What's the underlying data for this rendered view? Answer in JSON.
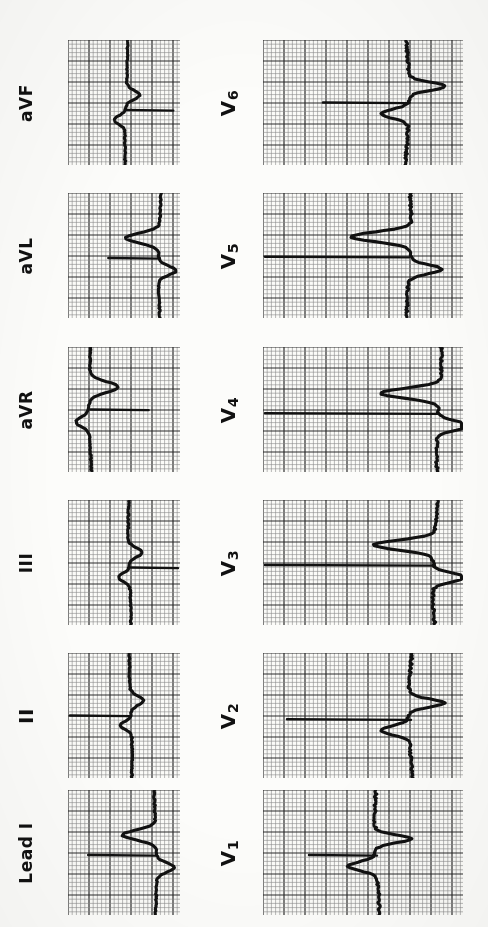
{
  "document": {
    "type": "12-lead electrocardiogram (ECG) scan",
    "orientation": "rotated-90-ccw",
    "background_color": "#fcfcfa",
    "trace_color": "#111111",
    "grid_fine_color": "#8a8a8a",
    "grid_bold_color": "#2b2b2b",
    "width": 488,
    "height": 927
  },
  "grid": {
    "fine_spacing_px": 4.2,
    "bold_every": 5,
    "fine_line_width": 0.6,
    "bold_line_width": 1.2
  },
  "columns": [
    {
      "id": "limb",
      "name": "limb-leads",
      "x": 68,
      "width": 112,
      "label_x": 26
    },
    {
      "id": "precordial",
      "name": "precordial-leads",
      "x": 263,
      "width": 200,
      "label_x": 228
    }
  ],
  "rows": [
    {
      "y": 40,
      "height": 125
    },
    {
      "y": 193,
      "height": 125
    },
    {
      "y": 347,
      "height": 125
    },
    {
      "y": 500,
      "height": 125
    },
    {
      "y": 653,
      "height": 125
    },
    {
      "y": 790,
      "height": 125
    }
  ],
  "leads": [
    {
      "name": "aVF",
      "label": "aVF",
      "sub": "",
      "column": "limb",
      "row": 0,
      "baseline_frac": 0.56,
      "spike_dir": "right",
      "spike_len_frac": 0.42,
      "qrs_axis_frac": 0.52,
      "morphology": "small-qrs-noisy-baseline"
    },
    {
      "name": "aVL",
      "label": "aVL",
      "sub": "",
      "column": "limb",
      "row": 1,
      "baseline_frac": 0.52,
      "spike_dir": "left",
      "spike_len_frac": 0.46,
      "qrs_axis_frac": 0.82,
      "morphology": "tall-r-right-shifted"
    },
    {
      "name": "aVR",
      "label": "aVR",
      "sub": "",
      "column": "limb",
      "row": 2,
      "baseline_frac": 0.5,
      "spike_dir": "right",
      "spike_len_frac": 0.52,
      "qrs_axis_frac": 0.2,
      "morphology": "deep-negative-left-shifted"
    },
    {
      "name": "III",
      "label": "III",
      "sub": "",
      "column": "limb",
      "row": 3,
      "baseline_frac": 0.54,
      "spike_dir": "right",
      "spike_len_frac": 0.62,
      "qrs_axis_frac": 0.55,
      "morphology": "biphasic-qrs"
    },
    {
      "name": "II",
      "label": "II",
      "sub": "",
      "column": "limb",
      "row": 4,
      "baseline_frac": 0.5,
      "spike_dir": "left",
      "spike_len_frac": 0.58,
      "qrs_axis_frac": 0.56,
      "morphology": "notched-qrs"
    },
    {
      "name": "Lead I",
      "label": "Lead I",
      "sub": "",
      "column": "limb",
      "row": 5,
      "baseline_frac": 0.52,
      "spike_dir": "left",
      "spike_len_frac": 0.6,
      "qrs_axis_frac": 0.78,
      "morphology": "tall-r-wide"
    },
    {
      "name": "V6",
      "label": "V",
      "sub": "6",
      "column": "precordial",
      "row": 0,
      "baseline_frac": 0.5,
      "spike_dir": "left",
      "spike_len_frac": 0.42,
      "qrs_axis_frac": 0.72,
      "morphology": "small-rs-complex"
    },
    {
      "name": "V5",
      "label": "V",
      "sub": "5",
      "column": "precordial",
      "row": 1,
      "baseline_frac": 0.51,
      "spike_dir": "left",
      "spike_len_frac": 0.78,
      "qrs_axis_frac": 0.73,
      "morphology": "tall-r-deep-s"
    },
    {
      "name": "V4",
      "label": "V",
      "sub": "4",
      "column": "precordial",
      "row": 2,
      "baseline_frac": 0.53,
      "spike_dir": "left",
      "spike_len_frac": 0.92,
      "qrs_axis_frac": 0.88,
      "morphology": "very-tall-r"
    },
    {
      "name": "V3",
      "label": "V",
      "sub": "3",
      "column": "precordial",
      "row": 3,
      "baseline_frac": 0.52,
      "spike_dir": "left",
      "spike_len_frac": 0.95,
      "qrs_axis_frac": 0.86,
      "morphology": "tall-r-rs-transition"
    },
    {
      "name": "V2",
      "label": "V",
      "sub": "2",
      "column": "precordial",
      "row": 4,
      "baseline_frac": 0.53,
      "spike_dir": "left",
      "spike_len_frac": 0.62,
      "qrs_axis_frac": 0.74,
      "morphology": "rs-complex"
    },
    {
      "name": "V1",
      "label": "V",
      "sub": "1",
      "column": "precordial",
      "row": 5,
      "baseline_frac": 0.52,
      "spike_dir": "left",
      "spike_len_frac": 0.34,
      "qrs_axis_frac": 0.57,
      "morphology": "small-r-large-s"
    }
  ],
  "chart_data": {
    "type": "line",
    "xlabel": "",
    "ylabel": "",
    "grid": true,
    "legend_position": "none",
    "note": "Scanned paper ECG, image rotated 90 degrees; each panel shows one cardiac cycle on 1mm/5mm graph paper.",
    "series": [
      {
        "name": "Lead I",
        "morphology": "tall R wave, wide QRS, prominent calibration baseline"
      },
      {
        "name": "II",
        "morphology": "notched QRS with noisy baseline"
      },
      {
        "name": "III",
        "morphology": "biphasic QRS, low amplitude"
      },
      {
        "name": "aVR",
        "morphology": "predominantly negative deflection"
      },
      {
        "name": "aVL",
        "morphology": "tall R wave"
      },
      {
        "name": "aVF",
        "morphology": "small QRS, noisy baseline"
      },
      {
        "name": "V1",
        "morphology": "small r wave with large S wave"
      },
      {
        "name": "V2",
        "morphology": "rS complex, deepening S"
      },
      {
        "name": "V3",
        "morphology": "tall R, transition zone"
      },
      {
        "name": "V4",
        "morphology": "very tall R wave"
      },
      {
        "name": "V5",
        "morphology": "tall R with deep S"
      },
      {
        "name": "V6",
        "morphology": "small RS complex"
      }
    ]
  }
}
